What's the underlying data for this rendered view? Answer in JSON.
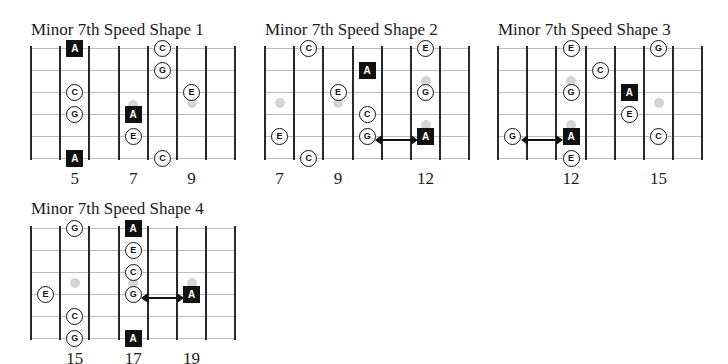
{
  "colors": {
    "root": "#111111",
    "outline": "#111111",
    "inlay": "#d4d4d4",
    "string": "#bdbdbd",
    "fret": "#2a2a2a"
  },
  "diagrams": [
    {
      "title": "Minor 7th Speed Shape 1",
      "origin": [
        31,
        48
      ],
      "title_pos": [
        31,
        20
      ],
      "first_fret": 4,
      "fret_labels": [
        {
          "fret": 5,
          "text": "5"
        },
        {
          "fret": 7,
          "text": "7"
        },
        {
          "fret": 9,
          "text": "9"
        }
      ],
      "inlays": [
        {
          "fret": 7,
          "y": 2.6
        },
        {
          "fret": 9,
          "y": 2.5
        }
      ],
      "notes": [
        {
          "string": 1,
          "fret": 5,
          "label": "A",
          "root": true
        },
        {
          "string": 6,
          "fret": 5,
          "label": "A",
          "root": true
        },
        {
          "string": 3,
          "fret": 5,
          "label": "C",
          "root": false
        },
        {
          "string": 4,
          "fret": 5,
          "label": "G",
          "root": false
        },
        {
          "string": 4,
          "fret": 7,
          "label": "A",
          "root": true
        },
        {
          "string": 5,
          "fret": 7,
          "label": "E",
          "root": false
        },
        {
          "string": 1,
          "fret": 8,
          "label": "C",
          "root": false
        },
        {
          "string": 2,
          "fret": 8,
          "label": "G",
          "root": false
        },
        {
          "string": 6,
          "fret": 8,
          "label": "C",
          "root": false
        },
        {
          "string": 3,
          "fret": 9,
          "label": "E",
          "root": false
        }
      ],
      "arrow": null
    },
    {
      "title": "Minor 7th Speed Shape 2",
      "origin": [
        265,
        48
      ],
      "title_pos": [
        265,
        20
      ],
      "first_fret": 7,
      "fret_labels": [
        {
          "fret": 7,
          "text": "7"
        },
        {
          "fret": 9,
          "text": "9"
        },
        {
          "fret": 12,
          "text": "12"
        }
      ],
      "inlays": [
        {
          "fret": 7,
          "y": 2.5
        },
        {
          "fret": 9,
          "y": 2.5
        },
        {
          "fret": 12,
          "y": 1.5
        },
        {
          "fret": 12,
          "y": 3.5
        }
      ],
      "notes": [
        {
          "string": 1,
          "fret": 8,
          "label": "C",
          "root": false
        },
        {
          "string": 1,
          "fret": 12,
          "label": "E",
          "root": false
        },
        {
          "string": 2,
          "fret": 10,
          "label": "A",
          "root": true
        },
        {
          "string": 3,
          "fret": 9,
          "label": "E",
          "root": false
        },
        {
          "string": 3,
          "fret": 12,
          "label": "G",
          "root": false
        },
        {
          "string": 4,
          "fret": 10,
          "label": "C",
          "root": false
        },
        {
          "string": 5,
          "fret": 10,
          "label": "G",
          "root": false
        },
        {
          "string": 5,
          "fret": 12,
          "label": "A",
          "root": true
        },
        {
          "string": 5,
          "fret": 7,
          "label": "E",
          "root": false
        },
        {
          "string": 6,
          "fret": 8,
          "label": "C",
          "root": false
        }
      ],
      "arrow": {
        "string": 5,
        "from": 10,
        "to": 12
      }
    },
    {
      "title": "Minor 7th Speed Shape 3",
      "origin": [
        498,
        48
      ],
      "title_pos": [
        498,
        20
      ],
      "first_fret": 10,
      "fret_labels": [
        {
          "fret": 12,
          "text": "12"
        },
        {
          "fret": 15,
          "text": "15"
        }
      ],
      "inlays": [
        {
          "fret": 12,
          "y": 1.5
        },
        {
          "fret": 12,
          "y": 3.5
        },
        {
          "fret": 15,
          "y": 2.5
        }
      ],
      "notes": [
        {
          "string": 1,
          "fret": 12,
          "label": "E",
          "root": false
        },
        {
          "string": 1,
          "fret": 15,
          "label": "G",
          "root": false
        },
        {
          "string": 2,
          "fret": 13,
          "label": "C",
          "root": false
        },
        {
          "string": 3,
          "fret": 12,
          "label": "G",
          "root": false
        },
        {
          "string": 3,
          "fret": 14,
          "label": "A",
          "root": true
        },
        {
          "string": 4,
          "fret": 14,
          "label": "E",
          "root": false
        },
        {
          "string": 5,
          "fret": 10,
          "label": "G",
          "root": false
        },
        {
          "string": 5,
          "fret": 12,
          "label": "A",
          "root": true
        },
        {
          "string": 5,
          "fret": 15,
          "label": "C",
          "root": false
        },
        {
          "string": 6,
          "fret": 12,
          "label": "E",
          "root": false
        }
      ],
      "arrow": {
        "string": 5,
        "from": 10,
        "to": 12
      }
    },
    {
      "title": "Minor 7th Speed Shape 4",
      "origin": [
        31,
        228
      ],
      "title_pos": [
        31,
        199
      ],
      "first_fret": 14,
      "fret_labels": [
        {
          "fret": 15,
          "text": "15"
        },
        {
          "fret": 17,
          "text": "17"
        },
        {
          "fret": 19,
          "text": "19"
        }
      ],
      "inlays": [
        {
          "fret": 15,
          "y": 2.5
        },
        {
          "fret": 17,
          "y": 2.5
        },
        {
          "fret": 19,
          "y": 2.5
        }
      ],
      "notes": [
        {
          "string": 1,
          "fret": 15,
          "label": "G",
          "root": false
        },
        {
          "string": 1,
          "fret": 17,
          "label": "A",
          "root": true
        },
        {
          "string": 2,
          "fret": 17,
          "label": "E",
          "root": false
        },
        {
          "string": 3,
          "fret": 17,
          "label": "C",
          "root": false
        },
        {
          "string": 4,
          "fret": 17,
          "label": "G",
          "root": false
        },
        {
          "string": 4,
          "fret": 14,
          "label": "E",
          "root": false
        },
        {
          "string": 4,
          "fret": 19,
          "label": "A",
          "root": true
        },
        {
          "string": 5,
          "fret": 15,
          "label": "C",
          "root": false
        },
        {
          "string": 6,
          "fret": 15,
          "label": "G",
          "root": false
        },
        {
          "string": 6,
          "fret": 17,
          "label": "A",
          "root": true
        }
      ],
      "arrow": {
        "string": 4,
        "from": 17,
        "to": 19
      }
    }
  ]
}
